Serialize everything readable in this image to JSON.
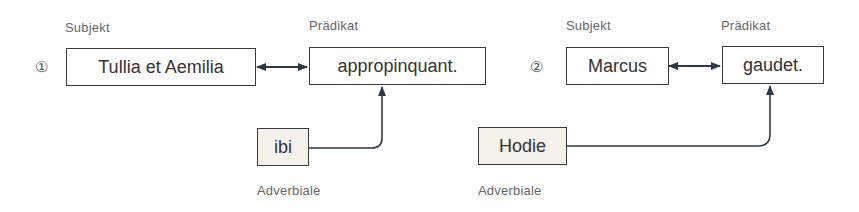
{
  "example1": {
    "number": "①",
    "subject_label": "Subjekt",
    "predicate_label": "Prädikat",
    "subject": "Tullia et Aemilia",
    "predicate": "appropinquant.",
    "adverbial": "ibi",
    "adverbial_label": "Adverbiale"
  },
  "example2": {
    "number": "②",
    "subject_label": "Subjekt",
    "predicate_label": "Prädikat",
    "subject": "Marcus",
    "predicate": "gaudet.",
    "adverbial": "Hodie",
    "adverbial_label": "Adverbiale"
  },
  "colors": {
    "box_border": "#3a3a3a",
    "adverbial_fill": "#f6f0ea",
    "arrow": "#2b3a4a",
    "label_text": "#666666"
  }
}
